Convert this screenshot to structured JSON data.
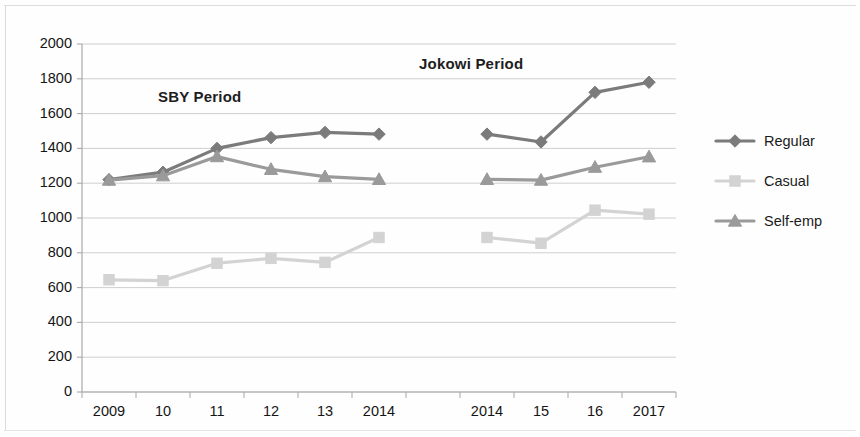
{
  "chart_data": {
    "type": "line",
    "title": "",
    "xlabel": "",
    "ylabel": "",
    "ylim": [
      0,
      2000
    ],
    "ytick_step": 200,
    "ytick_labels": [
      "2000",
      "1800",
      "1600",
      "1400",
      "1200",
      "1000",
      "800",
      "600",
      "400",
      "200",
      "0"
    ],
    "grid": true,
    "legend_position": "right",
    "categories": [
      "2009",
      "10",
      "11",
      "12",
      "13",
      "2014",
      "",
      "2014",
      "15",
      "16",
      "2017"
    ],
    "annotations": [
      {
        "text": "SBY Period",
        "category_span": [
          "2009",
          "2014"
        ]
      },
      {
        "text": "Jokowi Period",
        "category_span": [
          "2014",
          "2017"
        ]
      }
    ],
    "series": [
      {
        "name": "Regular",
        "marker": "diamond",
        "color": "#7b7b7b",
        "values": [
          1220,
          1263,
          1400,
          1462,
          1492,
          1482,
          null,
          1482,
          1437,
          1722,
          1780
        ]
      },
      {
        "name": "Casual",
        "marker": "square",
        "color": "#d3d3d3",
        "values": [
          645,
          640,
          740,
          768,
          745,
          888,
          null,
          888,
          855,
          1045,
          1022
        ]
      },
      {
        "name": "Self-emp",
        "marker": "triangle",
        "color": "#9a9a9a",
        "values": [
          1218,
          1243,
          1353,
          1280,
          1238,
          1222,
          null,
          1222,
          1218,
          1292,
          1352
        ]
      }
    ]
  },
  "annotations": {
    "sby_period": "SBY Period",
    "jokowi_period": "Jokowi Period"
  },
  "legend": {
    "items": [
      {
        "label": "Regular"
      },
      {
        "label": "Casual"
      },
      {
        "label": "Self-emp"
      }
    ]
  },
  "colors": {
    "regular": "#7b7b7b",
    "casual": "#d3d3d3",
    "self_emp": "#9a9a9a",
    "grid": "#c9c9c9",
    "axis": "#a8a8a8",
    "text": "#151515"
  }
}
